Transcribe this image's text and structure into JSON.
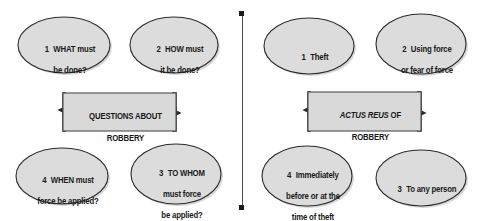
{
  "diagram": {
    "type": "flowchart",
    "title_visible": false,
    "divider": {
      "orientation": "vertical",
      "end_cap": "square-dot",
      "color": "#4a4a4a"
    },
    "panels": [
      {
        "id": "questions-about-robbery",
        "center": {
          "line1": "QUESTIONS ABOUT",
          "line2": "ROBBERY",
          "line1_italic_part": "",
          "line1_roman_part": "QUESTIONS ABOUT"
        },
        "nodes": [
          {
            "position": "top-left",
            "number": "1",
            "lines": [
              "WHAT must",
              "be done?"
            ]
          },
          {
            "position": "top-right",
            "number": "2",
            "lines": [
              "HOW must",
              "it be done?"
            ]
          },
          {
            "position": "bottom-left",
            "number": "4",
            "lines": [
              "WHEN must",
              "force be applied?"
            ]
          },
          {
            "position": "bottom-right",
            "number": "3",
            "lines": [
              "TO WHOM",
              "must force",
              "be applied?"
            ]
          }
        ]
      },
      {
        "id": "actus-reus-of-robbery",
        "center": {
          "line1": "ACTUS REUS OF",
          "line2": "ROBBERY",
          "line1_italic_part": "ACTUS REUS",
          "line1_roman_part": " OF"
        },
        "nodes": [
          {
            "position": "top-left",
            "number": "1",
            "lines": [
              "Theft"
            ]
          },
          {
            "position": "top-right",
            "number": "2",
            "lines": [
              "Using force",
              "or fear of force"
            ]
          },
          {
            "position": "bottom-left",
            "number": "4",
            "lines": [
              "Immediately",
              "before or at the",
              "time of theft"
            ]
          },
          {
            "position": "bottom-right",
            "number": "3",
            "lines": [
              "To any person"
            ]
          }
        ]
      }
    ],
    "colors": {
      "node_fill": "#dcdcdc",
      "node_stroke": "#2b2b2b",
      "box_fill": "#d9d9d9",
      "box_stroke": "#4d4d4d",
      "connector": "#2b2b2b",
      "text": "#1a1a1a",
      "background": "#ffffff"
    }
  }
}
